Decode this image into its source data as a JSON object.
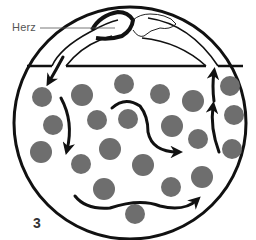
{
  "diagram": {
    "labels": {
      "heart": "Herz",
      "figure_number": "3"
    },
    "colors": {
      "outline": "#111111",
      "cell": "#6e6e6e",
      "label_text": "#555555",
      "background": "#ffffff"
    },
    "body_outline": {
      "cx": 130,
      "cy": 123,
      "r": 116
    },
    "cells": [
      {
        "cx": 42,
        "cy": 97,
        "r": 10
      },
      {
        "cx": 82,
        "cy": 95,
        "r": 11
      },
      {
        "cx": 124,
        "cy": 84,
        "r": 10
      },
      {
        "cx": 160,
        "cy": 94,
        "r": 10
      },
      {
        "cx": 193,
        "cy": 101,
        "r": 11
      },
      {
        "cx": 230,
        "cy": 86,
        "r": 10
      },
      {
        "cx": 53,
        "cy": 125,
        "r": 10
      },
      {
        "cx": 97,
        "cy": 120,
        "r": 10
      },
      {
        "cx": 128,
        "cy": 119,
        "r": 10
      },
      {
        "cx": 172,
        "cy": 126,
        "r": 11
      },
      {
        "cx": 234,
        "cy": 115,
        "r": 10
      },
      {
        "cx": 41,
        "cy": 152,
        "r": 11
      },
      {
        "cx": 110,
        "cy": 149,
        "r": 11
      },
      {
        "cx": 198,
        "cy": 139,
        "r": 10
      },
      {
        "cx": 232,
        "cy": 149,
        "r": 10
      },
      {
        "cx": 81,
        "cy": 164,
        "r": 10
      },
      {
        "cx": 143,
        "cy": 165,
        "r": 11
      },
      {
        "cx": 202,
        "cy": 177,
        "r": 11
      },
      {
        "cx": 104,
        "cy": 189,
        "r": 11
      },
      {
        "cx": 171,
        "cy": 187,
        "r": 10
      },
      {
        "cx": 135,
        "cy": 214,
        "r": 10
      }
    ],
    "flow_arrows": [
      {
        "name": "outflow-from-heart",
        "direction": "down-left"
      },
      {
        "name": "left-descending",
        "direction": "down"
      },
      {
        "name": "center-s-curve",
        "direction": "right"
      },
      {
        "name": "bottom-wave",
        "direction": "right"
      },
      {
        "name": "right-lower-ascending",
        "direction": "up"
      },
      {
        "name": "right-upper-ascending",
        "direction": "up"
      }
    ]
  }
}
